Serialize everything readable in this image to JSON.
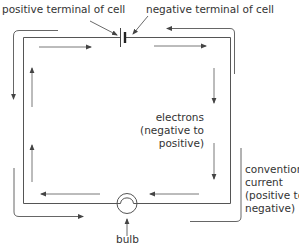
{
  "diagram": {
    "labels": {
      "positive_terminal": "positive terminal of cell",
      "negative_terminal": "negative terminal of cell",
      "electrons_line1": "electrons",
      "electrons_line2": "(negative to",
      "electrons_line3": "positive)",
      "conventional_line1": "conventional",
      "conventional_line2": "current",
      "conventional_line3": "(positive to",
      "conventional_line4": "negative)",
      "bulb": "bulb"
    },
    "components": [
      {
        "name": "cell",
        "type": "battery-cell"
      },
      {
        "name": "bulb",
        "type": "lamp"
      }
    ],
    "flows": [
      {
        "name": "electron-flow",
        "direction": "negative to positive",
        "placement": "inside circuit"
      },
      {
        "name": "conventional-current",
        "direction": "positive to negative",
        "placement": "outside circuit"
      }
    ],
    "colors": {
      "line": "#555555",
      "text": "#333333",
      "background": "#ffffff"
    }
  }
}
